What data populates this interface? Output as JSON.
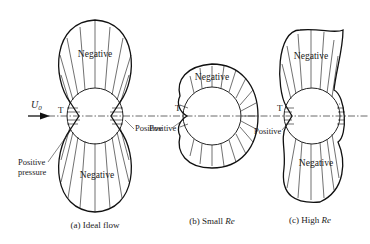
{
  "figure": {
    "panels": [
      {
        "id": "a",
        "caption": "(a) Ideal flow",
        "labels": {
          "top": "Negative",
          "bottom": "Negative",
          "T": "T",
          "positive": "Positive",
          "positive_pressure_line1": "Positive",
          "positive_pressure_line2": "pressure"
        }
      },
      {
        "id": "b",
        "caption_prefix": "(b) Small ",
        "caption_italic": "Re",
        "labels": {
          "top": "Negative",
          "T": "T",
          "positive": "Positive"
        }
      },
      {
        "id": "c",
        "caption_prefix": "(c) High ",
        "caption_italic": "Re",
        "labels": {
          "top": "Negative",
          "bottom": "Negative",
          "T": "T",
          "positive": "Positive"
        }
      }
    ],
    "flow_label": "U",
    "flow_subscript": "0"
  }
}
